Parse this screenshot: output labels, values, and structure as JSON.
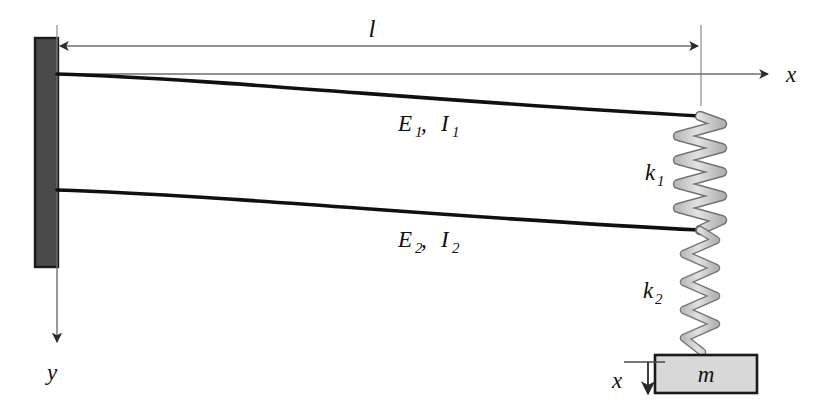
{
  "figure": {
    "type": "engineering-schematic",
    "background_color": "#ffffff",
    "line_color": "#101010",
    "thin_line_color": "#6e6e6e",
    "wall_fill": "#4a4a4a",
    "wall_stroke": "#1a1a1a",
    "spring_fill": "#cfcfcf",
    "spring_stroke": "#5c5c5c",
    "mass_fill": "#d8d8d8",
    "mass_stroke": "#1a1a1a"
  },
  "labels": {
    "length": "l",
    "axis_x_top": "x",
    "axis_y": "y",
    "beam1": {
      "symbol1": "E",
      "sub1": "1",
      "sep": ", ",
      "symbol2": "I",
      "sub2": "1",
      "full": "E1, I1"
    },
    "beam2": {
      "symbol1": "E",
      "sub1": "2",
      "sep": ", ",
      "symbol2": "I",
      "sub2": "2",
      "full": "E2, I2"
    },
    "spring1": {
      "symbol": "k",
      "sub": "1",
      "full": "k1"
    },
    "spring2": {
      "symbol": "k",
      "sub": "2",
      "full": "k2"
    },
    "mass": "m",
    "displacement_x": "x"
  },
  "components": {
    "wall": {
      "name": "fixed-support",
      "x": 35,
      "y": 38,
      "width": 23,
      "height": 229
    },
    "beam_upper": {
      "name": "upper-beam",
      "start_x": 57,
      "start_y": 74,
      "end_x": 700,
      "end_y": 116
    },
    "beam_lower": {
      "name": "lower-beam",
      "start_x": 57,
      "start_y": 190,
      "end_x": 700,
      "end_y": 230
    },
    "spring_upper": {
      "name": "spring-k1",
      "cx": 700,
      "top_y": 116,
      "bottom_y": 230,
      "coils": 9,
      "half_width": 22
    },
    "spring_lower": {
      "name": "spring-k2",
      "cx": 700,
      "top_y": 230,
      "bottom_y": 355,
      "coils": 8,
      "half_width": 15
    },
    "mass_block": {
      "name": "mass-block",
      "x": 655,
      "y": 355,
      "width": 102,
      "height": 38
    },
    "dimension_line": {
      "name": "length-dimension",
      "x1": 57,
      "x2": 701,
      "y": 46
    },
    "axis_x": {
      "name": "x-axis",
      "x1": 57,
      "x2": 772,
      "y": 74
    },
    "axis_y": {
      "name": "y-axis",
      "x": 57,
      "y1": 74,
      "y2": 348
    },
    "reference_line": {
      "name": "spring-reference-line",
      "x": 701,
      "y1": 25,
      "y2": 106
    },
    "displacement_arrow": {
      "name": "displacement-x-arrow",
      "x": 648,
      "y1": 362,
      "y2": 400
    }
  }
}
